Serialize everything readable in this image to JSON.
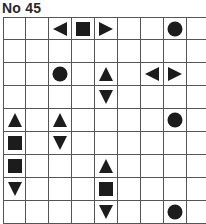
{
  "puzzle": {
    "title": "No 45",
    "rows": 9,
    "cols": 9,
    "cell_size": 23,
    "colors": {
      "symbol": "#1c1c1c",
      "grid_line": "#555555",
      "background": "#ffffff"
    },
    "cells": [
      {
        "row": 0,
        "col": 2,
        "symbol": "triangle-left"
      },
      {
        "row": 0,
        "col": 3,
        "symbol": "square"
      },
      {
        "row": 0,
        "col": 4,
        "symbol": "triangle-right"
      },
      {
        "row": 0,
        "col": 7,
        "symbol": "circle"
      },
      {
        "row": 2,
        "col": 2,
        "symbol": "circle"
      },
      {
        "row": 2,
        "col": 4,
        "symbol": "triangle-up"
      },
      {
        "row": 2,
        "col": 6,
        "symbol": "triangle-left"
      },
      {
        "row": 2,
        "col": 7,
        "symbol": "triangle-right"
      },
      {
        "row": 3,
        "col": 4,
        "symbol": "triangle-down"
      },
      {
        "row": 4,
        "col": 0,
        "symbol": "triangle-up"
      },
      {
        "row": 4,
        "col": 2,
        "symbol": "triangle-up"
      },
      {
        "row": 4,
        "col": 7,
        "symbol": "circle"
      },
      {
        "row": 5,
        "col": 0,
        "symbol": "square"
      },
      {
        "row": 5,
        "col": 2,
        "symbol": "triangle-down"
      },
      {
        "row": 6,
        "col": 0,
        "symbol": "square"
      },
      {
        "row": 6,
        "col": 4,
        "symbol": "triangle-up"
      },
      {
        "row": 7,
        "col": 0,
        "symbol": "triangle-down"
      },
      {
        "row": 7,
        "col": 4,
        "symbol": "square"
      },
      {
        "row": 8,
        "col": 4,
        "symbol": "triangle-down"
      },
      {
        "row": 8,
        "col": 7,
        "symbol": "circle"
      }
    ]
  }
}
